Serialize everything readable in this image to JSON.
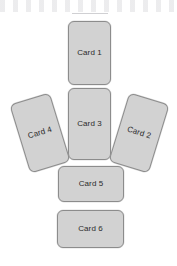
{
  "canvas": {
    "width": 177,
    "height": 266,
    "background_color": "#ffffff"
  },
  "style": {
    "card_fill": "#d2d2d2",
    "card_border": "#8c8c8c",
    "label_color": "#2b2b2b"
  },
  "cards": [
    {
      "id": "card-1",
      "label": "Card 1",
      "orientation": "portrait",
      "rotation_deg": 0,
      "x": 68,
      "y": 21,
      "width": 43,
      "height": 64
    },
    {
      "id": "card-2",
      "label": "Card 2",
      "orientation": "portrait",
      "rotation_deg": 17,
      "x": 118,
      "y": 97,
      "width": 42,
      "height": 72
    },
    {
      "id": "card-3",
      "label": "Card 3",
      "orientation": "portrait",
      "rotation_deg": 0,
      "x": 68,
      "y": 88,
      "width": 43,
      "height": 72
    },
    {
      "id": "card-4",
      "label": "Card 4",
      "orientation": "portrait",
      "rotation_deg": -17,
      "x": 19,
      "y": 97,
      "width": 42,
      "height": 72
    },
    {
      "id": "card-5",
      "label": "Card 5",
      "orientation": "landscape",
      "rotation_deg": 0,
      "x": 58,
      "y": 166,
      "width": 66,
      "height": 36
    },
    {
      "id": "card-6",
      "label": "Card 6",
      "orientation": "landscape",
      "rotation_deg": 0,
      "x": 57,
      "y": 210,
      "width": 67,
      "height": 38
    }
  ]
}
